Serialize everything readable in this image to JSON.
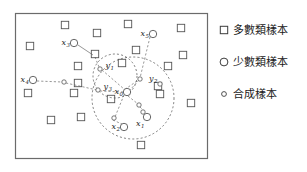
{
  "figure": {
    "title": "",
    "plot_box": {
      "x": 15,
      "y": 13,
      "width": 192,
      "height": 145,
      "border_color": "#6b6b6b"
    },
    "background": "#ffffff"
  },
  "legend": {
    "position": "right",
    "items": [
      {
        "marker": "square",
        "marker_name": "majority-square-marker",
        "label": "多數類樣本"
      },
      {
        "marker": "circle",
        "marker_name": "minority-circle-marker",
        "label": "少數類樣本"
      },
      {
        "marker": "small-circle",
        "marker_name": "synthetic-circle-marker",
        "label": "合成樣本"
      }
    ]
  },
  "chart_data": {
    "type": "scatter",
    "title": "",
    "xlabel": "",
    "ylabel": "",
    "xlim": [
      15,
      207
    ],
    "ylim": [
      13,
      158
    ],
    "grid": false,
    "legend_position": "right",
    "series": [
      {
        "name": "多數類樣本",
        "marker": "square",
        "color": "#555555",
        "points": [
          {
            "x": 65,
            "y": 25
          },
          {
            "x": 97,
            "y": 33
          },
          {
            "x": 128,
            "y": 24
          },
          {
            "x": 181,
            "y": 28
          },
          {
            "x": 30,
            "y": 46
          },
          {
            "x": 95,
            "y": 54
          },
          {
            "x": 136,
            "y": 50
          },
          {
            "x": 183,
            "y": 55
          },
          {
            "x": 78,
            "y": 66
          },
          {
            "x": 122,
            "y": 63
          },
          {
            "x": 168,
            "y": 66
          },
          {
            "x": 78,
            "y": 83
          },
          {
            "x": 28,
            "y": 93
          },
          {
            "x": 74,
            "y": 93
          },
          {
            "x": 158,
            "y": 86
          },
          {
            "x": 160,
            "y": 94
          },
          {
            "x": 111,
            "y": 99
          },
          {
            "x": 191,
            "y": 103
          },
          {
            "x": 51,
            "y": 120
          },
          {
            "x": 81,
            "y": 117
          },
          {
            "x": 141,
            "y": 145
          }
        ]
      },
      {
        "name": "少數類樣本",
        "marker": "circle",
        "color": "#555555",
        "points": [
          {
            "x": 74,
            "y": 43,
            "label": "x",
            "sub": "3",
            "label_side": "left"
          },
          {
            "x": 153,
            "y": 34,
            "label": "x",
            "sub": "5",
            "label_side": "left"
          },
          {
            "x": 33,
            "y": 80,
            "label": "x",
            "sub": "4",
            "label_side": "left"
          },
          {
            "x": 127,
            "y": 92,
            "label": "x",
            "sub": "0",
            "label_side": "left"
          },
          {
            "x": 147,
            "y": 117,
            "label": "x",
            "sub": "1",
            "label_side": "left-below"
          },
          {
            "x": 124,
            "y": 127,
            "label": "x",
            "sub": "2",
            "label_side": "left"
          }
        ]
      },
      {
        "name": "合成樣本",
        "marker": "small-circle",
        "color": "#555555",
        "points": [
          {
            "x": 100,
            "y": 69,
            "label": "y",
            "sub": "1",
            "label_side": "right"
          },
          {
            "x": 140,
            "y": 79,
            "label": "",
            "sub": ""
          },
          {
            "x": 160,
            "y": 84,
            "label": "y",
            "sub": "2",
            "label_side": "left-above"
          },
          {
            "x": 98,
            "y": 90,
            "label": "y",
            "sub": "3",
            "label_side": "right"
          },
          {
            "x": 64,
            "y": 82,
            "label": "",
            "sub": ""
          },
          {
            "x": 139,
            "y": 105,
            "label": "",
            "sub": ""
          },
          {
            "x": 143,
            "y": 112,
            "label": "",
            "sub": ""
          },
          {
            "x": 114,
            "y": 118,
            "label": "",
            "sub": ""
          }
        ]
      }
    ],
    "neighborhood_circles": [
      {
        "cx": 133,
        "cy": 98,
        "r": 41,
        "style": "dashed",
        "name": "large-neighborhood-circle"
      },
      {
        "cx": 115,
        "cy": 76,
        "r": 22,
        "style": "dashed",
        "name": "small-neighborhood-circle"
      }
    ],
    "connection_lines": [
      {
        "from": [
          78,
          45
        ],
        "to": [
          93,
          55
        ],
        "style": "solid"
      },
      {
        "from": [
          95,
          57
        ],
        "to": [
          99,
          67
        ],
        "style": "dashed"
      },
      {
        "from": [
          150,
          37
        ],
        "to": [
          140,
          78
        ],
        "style": "dashed"
      },
      {
        "from": [
          139,
          80
        ],
        "to": [
          130,
          90
        ],
        "style": "dashed"
      },
      {
        "from": [
          37,
          81
        ],
        "to": [
          62,
          82
        ],
        "style": "dashed"
      },
      {
        "from": [
          66,
          83
        ],
        "to": [
          97,
          90
        ],
        "style": "dashed"
      },
      {
        "from": [
          100,
          91
        ],
        "to": [
          123,
          92
        ],
        "style": "dashed"
      },
      {
        "from": [
          102,
          70
        ],
        "to": [
          124,
          89
        ],
        "style": "dashed"
      },
      {
        "from": [
          128,
          96
        ],
        "to": [
          138,
          104
        ],
        "style": "dashed"
      },
      {
        "from": [
          140,
          107
        ],
        "to": [
          143,
          110
        ],
        "style": "dashed"
      },
      {
        "from": [
          144,
          114
        ],
        "to": [
          146,
          115
        ],
        "style": "dashed"
      },
      {
        "from": [
          124,
          95
        ],
        "to": [
          115,
          117
        ],
        "style": "dashed"
      },
      {
        "from": [
          113,
          120
        ],
        "to": [
          124,
          125
        ],
        "style": "dashed"
      },
      {
        "from": [
          137,
          81
        ],
        "to": [
          124,
          90
        ],
        "style": "dashed"
      }
    ]
  }
}
